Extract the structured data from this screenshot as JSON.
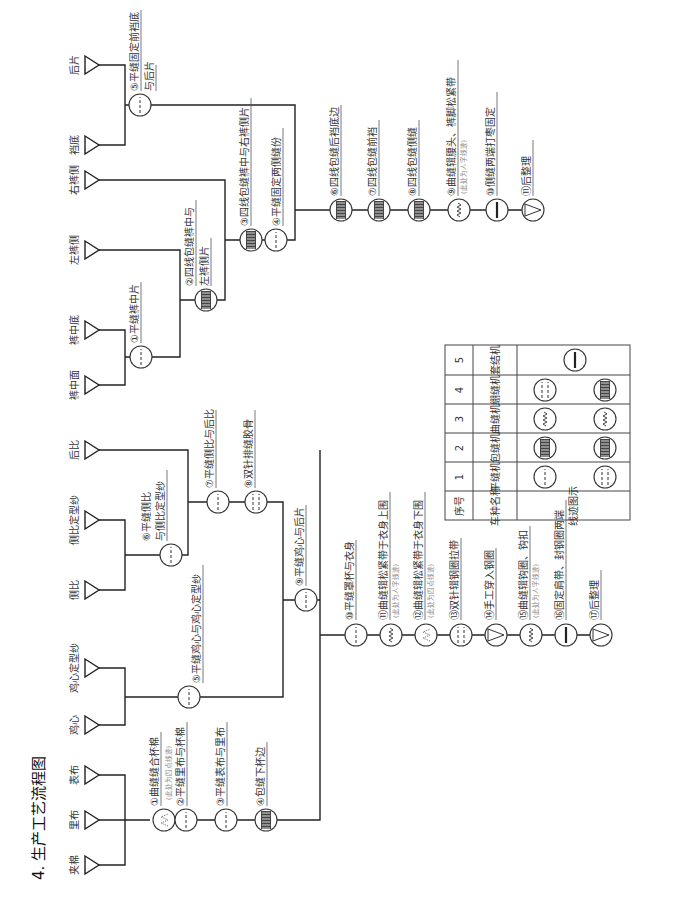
{
  "title": "4. 生产工艺流程图",
  "bra": {
    "materials": [
      "夹棉",
      "里布",
      "表布",
      "鸡心",
      "鸡心定型纱",
      "侧比",
      "侧比定型纱",
      "后比"
    ],
    "steps": [
      {
        "no": "①",
        "label": "曲缝缝合杯棉",
        "note": "(此处为四点线迹)",
        "machine": "zigzag-dots"
      },
      {
        "no": "②",
        "label": "平缝里布与杯棉",
        "machine": "lockstitch"
      },
      {
        "no": "③",
        "label": "平缝表布与里布",
        "machine": "lockstitch"
      },
      {
        "no": "④",
        "label": "包缝下杯边",
        "machine": "overlock"
      },
      {
        "no": "⑤",
        "label": "平缝鸡心与鸡心定型纱",
        "machine": "lockstitch"
      },
      {
        "no": "⑥",
        "label": "平缝侧比",
        "label2": "与侧比定型纱",
        "machine": "lockstitch"
      },
      {
        "no": "⑦",
        "label": "平缝侧比与后比",
        "machine": "lockstitch"
      },
      {
        "no": "⑧",
        "label": "双针排缝胶骨",
        "machine": "double-needle"
      },
      {
        "no": "⑨",
        "label": "平缝鸡心与后片",
        "machine": "lockstitch"
      },
      {
        "no": "⑩",
        "label": "平缝罩杯与衣身",
        "machine": "lockstitch"
      },
      {
        "no": "⑪",
        "label": "曲缝辑松紧带于衣身上围",
        "note": "(此处为人字线迹)",
        "machine": "zigzag"
      },
      {
        "no": "⑫",
        "label": "曲缝辑松紧带于衣身下围",
        "note": "(此处为四点线迹)",
        "machine": "zigzag-dots"
      },
      {
        "no": "⑬",
        "label": "双针辑钢圈拉带",
        "machine": "double-needle"
      },
      {
        "no": "⑭",
        "label": "手工穿入钢圈",
        "machine": "manual"
      },
      {
        "no": "⑮",
        "label": "曲缝辑钩圈、钩扣",
        "note": "(此处为人字线迹)",
        "machine": "zigzag"
      },
      {
        "no": "⑯",
        "label": "固定肩带、封钢圈两端",
        "machine": "bartack"
      },
      {
        "no": "⑰",
        "label": "后整理",
        "machine": "finish"
      }
    ]
  },
  "pants": {
    "materials": [
      "裤中面",
      "裤中底",
      "左裤侧",
      "右裤侧",
      "裆底",
      "后片"
    ],
    "steps": [
      {
        "no": "①",
        "label": "平缝裤中片",
        "machine": "lockstitch"
      },
      {
        "no": "②",
        "label": "四线包缝裤中与",
        "label2": "左裤侧片",
        "machine": "overlock"
      },
      {
        "no": "③",
        "label": "四线包缝裤中与右裤侧片",
        "machine": "overlock"
      },
      {
        "no": "④",
        "label": "平缝固定两侧缝份",
        "machine": "lockstitch"
      },
      {
        "no": "⑤",
        "label": "平缝固定前裆底",
        "label2": "与后片",
        "machine": "lockstitch"
      },
      {
        "no": "⑥",
        "label": "四线包缝后裆底边",
        "machine": "overlock"
      },
      {
        "no": "⑦",
        "label": "四线包缝前裆",
        "machine": "overlock"
      },
      {
        "no": "⑧",
        "label": "四线包缝侧缝",
        "machine": "overlock"
      },
      {
        "no": "⑨",
        "label": "曲缝辑腰头、裤脚松紧带",
        "note": "(此处为人字线迹)",
        "machine": "zigzag"
      },
      {
        "no": "⑩",
        "label": "侧缝两端打枣固定",
        "machine": "bartack"
      },
      {
        "no": "⑪",
        "label": "后整理",
        "machine": "finish"
      }
    ]
  },
  "legend": {
    "headers": [
      "序号",
      "车种名称",
      "线迹图示"
    ],
    "rows": [
      {
        "no": "1",
        "name": "平缝机"
      },
      {
        "no": "2",
        "name": "包缝机"
      },
      {
        "no": "3",
        "name": "曲缝机"
      },
      {
        "no": "4",
        "name": "绷缝机"
      },
      {
        "no": "5",
        "name": "套结机"
      }
    ]
  },
  "icons": {
    "material": "triangle-icon",
    "lockstitch": "dashed-circle-icon",
    "overlock": "hatched-circle-icon",
    "zigzag": "zigzag-circle-icon",
    "zigzag-dots": "dotted-zigzag-circle-icon",
    "double-needle": "double-dashed-circle-icon",
    "bartack": "bartack-circle-icon",
    "manual": "triangle-circle-icon",
    "finish": "triangle-circle-icon"
  }
}
